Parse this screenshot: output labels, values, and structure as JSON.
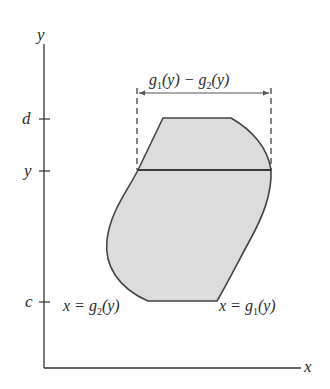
{
  "diagram": {
    "axes": {
      "x_label": "x",
      "y_label": "y",
      "y_ticks": [
        {
          "label": "d",
          "y": 119
        },
        {
          "label": "y",
          "y": 171
        },
        {
          "label": "c",
          "y": 302
        }
      ]
    },
    "width_annotation": {
      "label_g1": "g",
      "label_g1_sub": "1",
      "label_mid": "(y) − g",
      "label_g2_sub": "2",
      "label_end": "(y)"
    },
    "left_curve_label": {
      "prefix": "x = g",
      "sub": "2",
      "suffix": "(y)"
    },
    "right_curve_label": {
      "prefix": "x = g",
      "sub": "1",
      "suffix": "(y)"
    },
    "colors": {
      "region_fill": "#dcdcdc",
      "outline": "#444444",
      "axis": "#333333",
      "text": "#2a2a2a"
    }
  }
}
